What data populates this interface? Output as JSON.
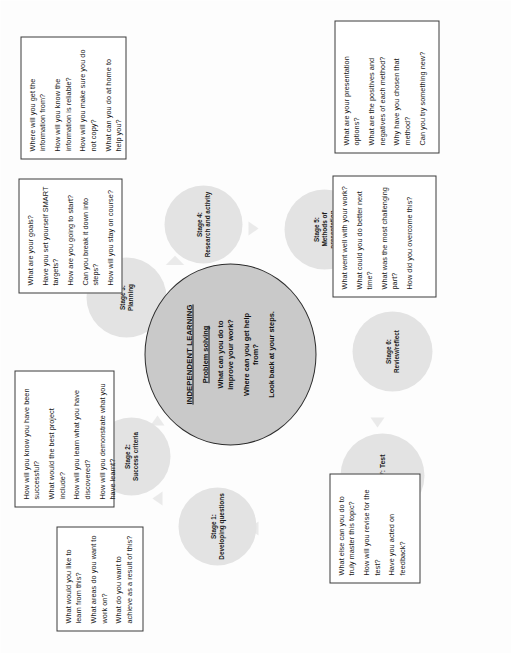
{
  "diagram": {
    "core": {
      "title": "INDEPENDENT LEARNING",
      "subtitle": "Problem solving",
      "lines": [
        "What can you do to improve your work?",
        "Where can you get help from?",
        "Look back at your steps."
      ]
    },
    "stages": [
      {
        "id": "stage-1",
        "label": "Stage 1:\nDeveloping questions",
        "number": "Stage 1:",
        "name": "Developing questions"
      },
      {
        "id": "stage-2",
        "label": "Stage 2:\nSuccess criteria",
        "number": "Stage 2:",
        "name": "Success criteria"
      },
      {
        "id": "stage-3",
        "label": "Stage 3:\nPlanning",
        "number": "Stage 3:",
        "name": "Planning"
      },
      {
        "id": "stage-4",
        "label": "Stage 4:\nResearch and activity",
        "number": "Stage 4:",
        "name": "Research and activity"
      },
      {
        "id": "stage-5",
        "label": "Stage 5:\nMethods of presentation",
        "number": "Stage 5:",
        "name": "Methods of presentation"
      },
      {
        "id": "stage-6",
        "label": "Stage 6:\nReview/reflect",
        "number": "Stage 6:",
        "name": "Review/reflect"
      },
      {
        "id": "stage-7",
        "label": "Stage 7: Test",
        "number": "Stage 7:",
        "name": "Test"
      }
    ],
    "boxes": {
      "developing_questions": {
        "questions": [
          "What would you like to learn from this?",
          "What areas do you want to work on?",
          "What do you want to achieve as a result of this?"
        ]
      },
      "success_criteria": {
        "questions": [
          "How will you know you have been successful?",
          "What would the best project include?",
          "How will you learn what you have discovered?",
          "How will you demonstrate what you have learnt?"
        ]
      },
      "planning": {
        "questions": [
          "What are your goals?",
          "Have you set yourself SMART targets?",
          "How are you going to start?",
          "Can you break it down into steps?",
          "How will you stay on course?"
        ]
      },
      "research_and_activity": {
        "questions": [
          "Where will you get the information from?",
          "How will you know the information is reliable?",
          "How will you make sure you do not copy?",
          "What can you do at home to help you?"
        ]
      },
      "methods_of_presentation": {
        "questions": [
          "What are your presentation options?",
          "What are the positives and negatives of each method?",
          "Why have you chosen that method?",
          "Can you try something new?"
        ]
      },
      "review_reflect": {
        "questions": [
          "What went well with your work?",
          "What could you do better next time?",
          "What was the most challenging part?",
          "How did you overcome this?"
        ]
      },
      "test": {
        "questions": [
          "What else can you do to truly master this topic?",
          "How will you revise for the test?",
          "Have you acted on feedback?"
        ]
      }
    },
    "colors": {
      "core_fill": "#c9c9c9",
      "core_stroke": "#2c2c2c",
      "stage_fill": "#e3e3e3",
      "box_border": "#3a3a3a",
      "arrow_fill": "#e6e6e6",
      "background": "#ffffff"
    }
  }
}
